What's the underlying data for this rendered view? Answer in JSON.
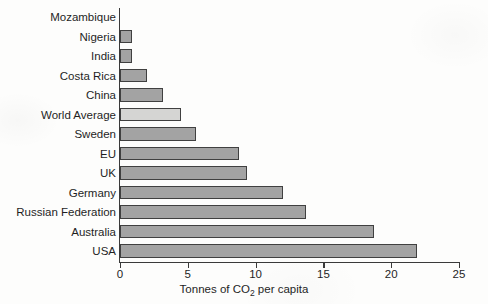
{
  "chart_data": {
    "type": "bar",
    "orientation": "horizontal",
    "title": "",
    "xlabel": "Tonnes of CO2 per capita",
    "xlabel_parts": {
      "before": "Tonnes of CO",
      "sub": "2",
      "after": " per capita"
    },
    "ylabel": "",
    "xlim": [
      0,
      25
    ],
    "xticks": [
      0,
      5,
      10,
      15,
      20,
      25
    ],
    "xtick_labels": [
      "0",
      "5",
      "10",
      "15",
      "20",
      "25"
    ],
    "grid": false,
    "legend": false,
    "categories": [
      "Mozambique",
      "Nigeria",
      "India",
      "Costa Rica",
      "China",
      "World Average",
      "Sweden",
      "EU",
      "UK",
      "Germany",
      "Russian Federation",
      "Australia",
      "USA"
    ],
    "values": [
      0.1,
      0.9,
      0.9,
      2.0,
      3.2,
      4.5,
      5.6,
      8.8,
      9.4,
      12.0,
      13.7,
      18.7,
      21.9
    ],
    "highlight_category": "World Average",
    "colors": {
      "bar_fill": "#a3a3a3",
      "bar_highlight_fill": "#d5d5d3",
      "bar_stroke": "#404040",
      "axis": "#3a3a3a",
      "text": "#1f1f1f",
      "background": "#fdfdfc"
    }
  }
}
